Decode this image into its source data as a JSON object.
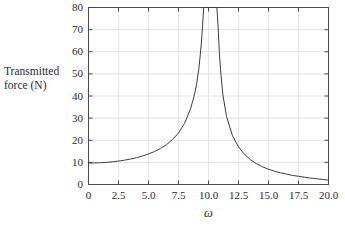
{
  "chart_data": {
    "type": "line",
    "title": "",
    "subtitle": "",
    "xlabel": "ω",
    "ylabel": "Transmitted force (N)",
    "ylabel_lines": [
      "Transmitted",
      "force (N)"
    ],
    "xlim": [
      0,
      20
    ],
    "ylim": [
      0,
      80
    ],
    "grid": true,
    "legend": null,
    "xticks": [
      0,
      2.5,
      5.0,
      7.5,
      10.0,
      12.5,
      15.0,
      17.5,
      20.0
    ],
    "xticklabels": [
      "0",
      "2.5",
      "5.0",
      "7.5",
      "10.0",
      "12.5",
      "15.0",
      "17.5",
      "20.0"
    ],
    "yticks": [
      0,
      10,
      20,
      30,
      40,
      50,
      60,
      70,
      80
    ],
    "yticklabels": [
      "0",
      "10",
      "20",
      "30",
      "40",
      "50",
      "60",
      "70",
      "80"
    ],
    "resonance_omega": 10.2,
    "series": [
      {
        "name": "Transmitted force",
        "color": "#3d3d3d",
        "linewidth": 1,
        "x": [
          0,
          0.5,
          1.0,
          1.5,
          2.0,
          2.5,
          3.0,
          3.5,
          4.0,
          4.5,
          5.0,
          5.5,
          6.0,
          6.5,
          7.0,
          7.5,
          8.0,
          8.5,
          8.8,
          9.0,
          9.2,
          9.4,
          9.5,
          9.6,
          9.7,
          9.8,
          9.85,
          9.9,
          9.95,
          10.45,
          10.5,
          10.55,
          10.6,
          10.7,
          10.8,
          10.9,
          11.0,
          11.2,
          11.5,
          12.0,
          12.5,
          13.0,
          13.5,
          14.0,
          14.5,
          15.0,
          15.5,
          16.0,
          16.5,
          17.0,
          17.5,
          18.0,
          18.5,
          19.0,
          19.5,
          20.0
        ],
        "y": [
          9.7,
          9.75,
          9.85,
          10.0,
          10.25,
          10.6,
          11.0,
          11.5,
          12.1,
          12.9,
          13.8,
          14.9,
          16.3,
          18.0,
          20.3,
          23.3,
          27.6,
          34.2,
          39.9,
          45.1,
          52.4,
          63.5,
          71.3,
          80.0,
          80.0,
          80.0,
          80.0,
          80.0,
          80.0,
          80.0,
          80.0,
          80.0,
          80.0,
          80.0,
          71.0,
          60.2,
          52.0,
          40.5,
          30.8,
          22.0,
          17.0,
          13.6,
          11.2,
          9.4,
          8.0,
          6.9,
          6.0,
          5.3,
          4.7,
          4.1,
          3.7,
          3.3,
          2.9,
          2.6,
          2.3,
          2.0
        ]
      }
    ],
    "colors": {
      "axis": "#4a4a4a",
      "grid": "#e3e3e3",
      "curve": "#3d3d3d",
      "text": "#2b2b2b",
      "background": "#ffffff"
    }
  }
}
